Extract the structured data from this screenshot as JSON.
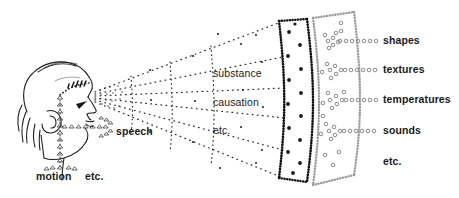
{
  "figure": {
    "background_color": "#ffffff",
    "ink_color": "#1a1a1a",
    "mid_dot_color": "#3a3a3a",
    "outer_circle_color": "#8a8a8a"
  },
  "source": {
    "name": "head-profile",
    "description": "Side view of a human head facing right with eye, nose, mouth, ear and hair"
  },
  "inner_labels": [
    {
      "id": "substance",
      "text": "substance",
      "x": 213,
      "y": 74
    },
    {
      "id": "causation",
      "text": "causation",
      "x": 213,
      "y": 103
    },
    {
      "id": "inner-etc",
      "text": "etc.",
      "x": 213,
      "y": 131
    }
  ],
  "outer_labels": [
    {
      "id": "shapes",
      "text": "shapes",
      "x": 383,
      "y": 40
    },
    {
      "id": "textures",
      "text": "textures",
      "x": 383,
      "y": 69
    },
    {
      "id": "temperatures",
      "text": "temperatures",
      "x": 383,
      "y": 99
    },
    {
      "id": "sounds",
      "text": "sounds",
      "x": 383,
      "y": 130
    },
    {
      "id": "outer-etc",
      "text": "etc.",
      "x": 383,
      "y": 161
    }
  ],
  "output_labels": [
    {
      "id": "speech",
      "text": "speech",
      "x": 116,
      "y": 131
    },
    {
      "id": "motion",
      "text": "motion",
      "x": 36,
      "y": 176
    },
    {
      "id": "motion-etc",
      "text": "etc.",
      "x": 85,
      "y": 176
    }
  ],
  "zones": {
    "inner_cone": "dotted ray fan from eye, subdivided by dotted arcs",
    "middle_band": "band bounded by dense black dotted arcs, filled dots inside",
    "outer_band": "band bounded by open-circle arcs, circle clusters inside"
  }
}
